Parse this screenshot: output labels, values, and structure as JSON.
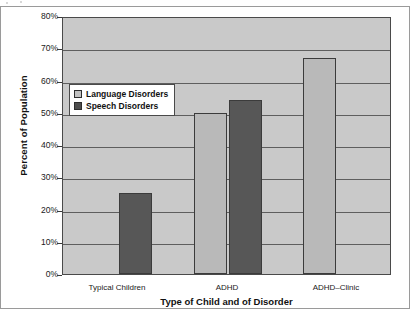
{
  "chart_data": {
    "type": "bar",
    "title": "",
    "xlabel": "Type of Child and of Disorder",
    "ylabel": "Percent of Population",
    "categories": [
      "Typical Children",
      "ADHD",
      "ADHD–Clinic"
    ],
    "series": [
      {
        "name": "Language Disorders",
        "color": "#b9b9b9",
        "values": [
          null,
          50,
          67
        ]
      },
      {
        "name": "Speech Disorders",
        "color": "#575757",
        "values": [
          25,
          54,
          null
        ]
      }
    ],
    "ylim": [
      0,
      80
    ],
    "ytick_labels": [
      "0%",
      "10%",
      "20%",
      "30%",
      "40%",
      "50%",
      "60%",
      "70%",
      "80%"
    ],
    "ytick_values": [
      0,
      10,
      20,
      30,
      40,
      50,
      60,
      70,
      80
    ],
    "grid": true,
    "legend_position": "inside-upper-left",
    "plot_background": "#c9c9c9"
  },
  "legend": {
    "entries": [
      {
        "label": "Language Disorders",
        "swatch": "language"
      },
      {
        "label": "Speech Disorders",
        "swatch": "speech"
      }
    ]
  }
}
